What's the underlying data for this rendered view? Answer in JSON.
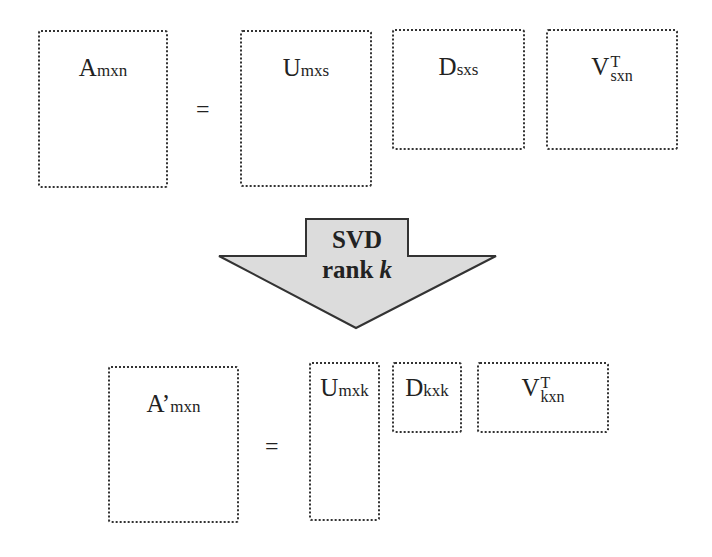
{
  "top_equation": {
    "lhs": {
      "base": "A",
      "sub": "mxn"
    },
    "equals": "=",
    "rhs": [
      {
        "base": "U",
        "sub": "mxs"
      },
      {
        "base": "D",
        "sub": "sxs"
      },
      {
        "base": "V",
        "sub": "sxn",
        "sup": "T"
      }
    ]
  },
  "arrow": {
    "line1": "SVD",
    "line2_text": "rank ",
    "line2_var": "k",
    "fill": "#dcdcdc",
    "stroke": "#333333"
  },
  "bottom_equation": {
    "lhs": {
      "base": "A’",
      "sub": "mxn"
    },
    "equals": "=",
    "rhs": [
      {
        "base": "U",
        "sub": "mxk"
      },
      {
        "base": "D",
        "sub": "kxk"
      },
      {
        "base": "V",
        "sub": "kxn",
        "sup": "T"
      }
    ]
  }
}
